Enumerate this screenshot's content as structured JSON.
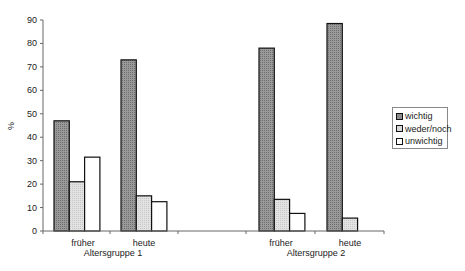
{
  "chart_data": {
    "type": "bar",
    "title": "",
    "xlabel": "",
    "ylabel": "%",
    "ylim": [
      0,
      90
    ],
    "yticks": [
      0,
      10,
      20,
      30,
      40,
      50,
      60,
      70,
      80,
      90
    ],
    "grid": false,
    "legend_position": "right",
    "groups": [
      {
        "label": "Altersgruppe 1",
        "categories": [
          "früher",
          "heute"
        ]
      },
      {
        "label": "Altersgruppe 2",
        "categories": [
          "früher",
          "heute"
        ]
      }
    ],
    "categories": [
      "Altersgruppe 1 früher",
      "Altersgruppe 1 heute",
      "",
      "Altersgruppe 2 früher",
      "Altersgruppe 2 heute"
    ],
    "series": [
      {
        "name": "wichtig",
        "color": "#8c8c8c",
        "values": [
          47,
          73,
          null,
          78,
          88.5
        ]
      },
      {
        "name": "weder/noch",
        "color": "#d9d9d9",
        "values": [
          21,
          15,
          null,
          13.5,
          5.5
        ]
      },
      {
        "name": "unwichtig",
        "color": "#ffffff",
        "values": [
          31.5,
          12.5,
          null,
          7.5,
          0
        ]
      }
    ]
  },
  "axis": {
    "ylabel": "%",
    "ticks": [
      "0",
      "10",
      "20",
      "30",
      "40",
      "50",
      "60",
      "70",
      "80",
      "90"
    ]
  },
  "xlabels": {
    "ag1_frueher": "früher",
    "ag1_heute": "heute",
    "ag1_group": "Altersgruppe 1",
    "ag2_frueher": "früher",
    "ag2_heute": "heute",
    "ag2_group": "Altersgruppe 2"
  },
  "legend": {
    "items": [
      {
        "label": "wichtig",
        "color": "#8c8c8c"
      },
      {
        "label": "weder/noch",
        "color": "#d9d9d9"
      },
      {
        "label": "unwichtig",
        "color": "#ffffff"
      }
    ]
  }
}
